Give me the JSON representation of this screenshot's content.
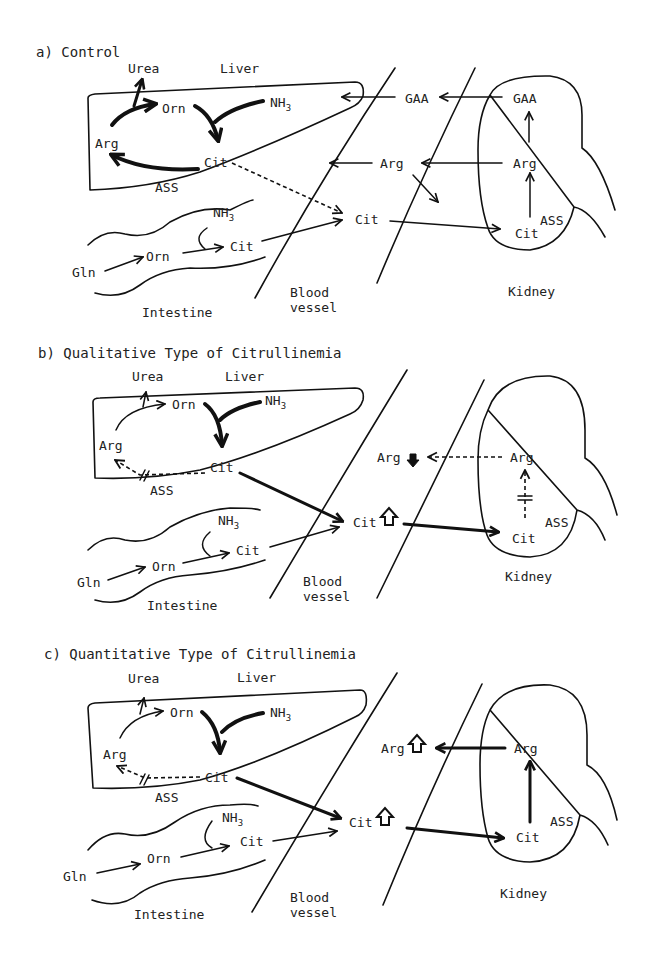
{
  "panels": [
    {
      "title": "a) Control",
      "labels": {
        "urea": "Urea",
        "liver": "Liver",
        "orn": "Orn",
        "nh3": "NH",
        "nh3_sub": "3",
        "arg": "Arg",
        "cit": "Cit",
        "ass": "ASS",
        "gaa_blood": "GAA",
        "arg_blood": "Arg",
        "cit_blood": "Cit",
        "gaa_kidney": "GAA",
        "arg_kidney": "Arg",
        "cit_kidney": "Cit",
        "ass_kidney": "ASS",
        "int_nh3": "NH",
        "int_nh3_sub": "3",
        "int_cit": "Cit",
        "int_orn": "Orn",
        "gln": "Gln",
        "intestine": "Intestine",
        "blood1": "Blood",
        "blood2": "vessel",
        "kidney": "Kidney"
      }
    },
    {
      "title": "b) Qualitative Type of Citrullinemia",
      "labels": {
        "urea": "Urea",
        "liver": "Liver",
        "orn": "Orn",
        "nh3": "NH",
        "nh3_sub": "3",
        "arg": "Arg",
        "cit": "Cit",
        "ass": "ASS",
        "arg_blood": "Arg",
        "cit_blood": "Cit",
        "arg_kidney": "Arg",
        "cit_kidney": "Cit",
        "ass_kidney": "ASS",
        "int_nh3": "NH",
        "int_nh3_sub": "3",
        "int_cit": "Cit",
        "int_orn": "Orn",
        "gln": "Gln",
        "intestine": "Intestine",
        "blood1": "Blood",
        "blood2": "vessel",
        "kidney": "Kidney"
      },
      "indicators": {
        "arg_blood": "decreased",
        "cit_blood": "increased"
      }
    },
    {
      "title": "c) Quantitative Type of Citrullinemia",
      "labels": {
        "urea": "Urea",
        "liver": "Liver",
        "orn": "Orn",
        "nh3": "NH",
        "nh3_sub": "3",
        "arg": "Arg",
        "cit": "Cit",
        "ass": "ASS",
        "arg_blood": "Arg",
        "cit_blood": "Cit",
        "arg_kidney": "Arg",
        "cit_kidney": "Cit",
        "ass_kidney": "ASS",
        "int_nh3": "NH",
        "int_nh3_sub": "3",
        "int_cit": "Cit",
        "int_orn": "Orn",
        "gln": "Gln",
        "intestine": "Intestine",
        "blood1": "Blood",
        "blood2": "vessel",
        "kidney": "Kidney"
      },
      "indicators": {
        "arg_blood": "increased",
        "cit_blood": "increased"
      }
    }
  ]
}
